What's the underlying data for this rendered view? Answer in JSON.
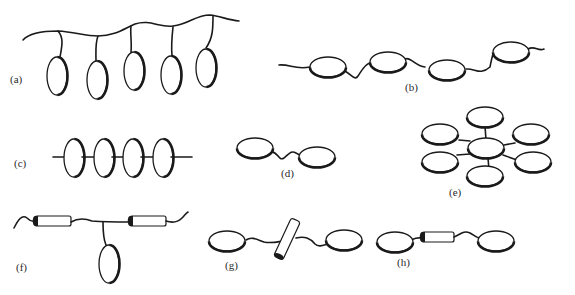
{
  "figure": {
    "panels": [
      {
        "id": "a",
        "label": "(a)",
        "description": "five vertical disks hanging from a wavy chain"
      },
      {
        "id": "b",
        "label": "(b)",
        "description": "four flat disks linked in series by a wavy chain"
      },
      {
        "id": "c",
        "label": "(c)",
        "description": "four vertical disks threaded on a straight rod"
      },
      {
        "id": "d",
        "label": "(d)",
        "description": "two flat disks joined by a short wavy linker"
      },
      {
        "id": "e",
        "label": "(e)",
        "description": "central disk with six surrounding disks (star arrangement)"
      },
      {
        "id": "f",
        "label": "(f)",
        "description": "chain with two rod segments and one pendant vertical disk"
      },
      {
        "id": "g",
        "label": "(g)",
        "description": "two flat disks with a tilted rod in the linker"
      },
      {
        "id": "h",
        "label": "(h)",
        "description": "two flat disks with a horizontal rod in the linker"
      }
    ]
  },
  "colors": {
    "stroke": "#1a1a1a",
    "fill": "#ffffff",
    "background": "#ffffff"
  }
}
